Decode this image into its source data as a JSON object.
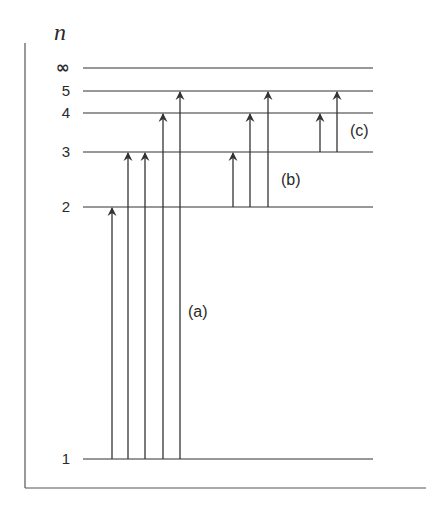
{
  "diagram": {
    "axis_label": "n",
    "colors": {
      "line": "#333333",
      "text": "#2a2a2a",
      "frame": "#555555"
    },
    "frame": {
      "left_x": 25,
      "top_y": 43,
      "bottom_y": 488,
      "right_x": 426
    },
    "levels": [
      {
        "n": "∞",
        "label": "∞",
        "y": 68
      },
      {
        "n": "5",
        "label": "5",
        "y": 91
      },
      {
        "n": "4",
        "label": "4",
        "y": 113
      },
      {
        "n": "3",
        "label": "3",
        "y": 152
      },
      {
        "n": "2",
        "label": "2",
        "y": 207
      },
      {
        "n": "1",
        "label": "1",
        "y": 459
      }
    ],
    "level_line": {
      "x1": 83,
      "x2": 373
    },
    "series": [
      {
        "name": "(a)",
        "label": "(a)",
        "label_pos": {
          "x": 188,
          "y": 317
        },
        "transitions": [
          {
            "from": "1",
            "to": "2",
            "x": 112
          },
          {
            "from": "1",
            "to": "3",
            "x": 128
          },
          {
            "from": "1",
            "to": "3",
            "x": 145
          },
          {
            "from": "1",
            "to": "4",
            "x": 163
          },
          {
            "from": "1",
            "to": "5",
            "x": 180
          }
        ]
      },
      {
        "name": "(b)",
        "label": "(b)",
        "label_pos": {
          "x": 281,
          "y": 185
        },
        "transitions": [
          {
            "from": "2",
            "to": "3",
            "x": 233
          },
          {
            "from": "2",
            "to": "4",
            "x": 250
          },
          {
            "from": "2",
            "to": "5",
            "x": 268
          }
        ]
      },
      {
        "name": "(c)",
        "label": "(c)",
        "label_pos": {
          "x": 350,
          "y": 136
        },
        "transitions": [
          {
            "from": "3",
            "to": "4",
            "x": 320
          },
          {
            "from": "3",
            "to": "5",
            "x": 337
          }
        ]
      }
    ]
  }
}
